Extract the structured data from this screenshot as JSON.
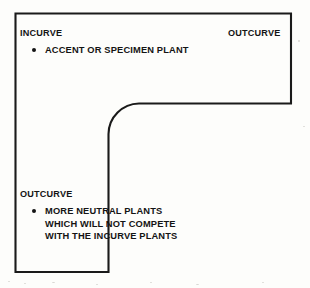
{
  "diagram": {
    "stroke_color": "#1a1a1a",
    "background_color": "#fdfdfb",
    "shape": "reverse-L bed outline with concave rounded inner corner",
    "zones": {
      "incurve_label": "INCURVE",
      "outcurve_top_label": "OUTCURVE",
      "outcurve_bottom_label": "OUTCURVE"
    },
    "notes": {
      "incurve_note": "ACCENT OR SPECIMEN PLANT",
      "outcurve_note": "MORE NEUTRAL PLANTS\nWHICH WILL NOT COMPETE\nWITH THE INCURVE PLANTS"
    }
  }
}
